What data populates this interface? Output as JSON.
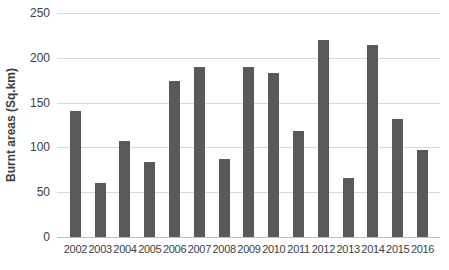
{
  "chart_data": {
    "type": "bar",
    "title": "",
    "categories": [
      "2002",
      "2003",
      "2004",
      "2005",
      "2006",
      "2007",
      "2008",
      "2009",
      "2010",
      "2011",
      "2012",
      "2013",
      "2014",
      "2015",
      "2016"
    ],
    "values": [
      141,
      60,
      107,
      84,
      174,
      190,
      87,
      190,
      183,
      118,
      220,
      66,
      214,
      132,
      97
    ],
    "xlabel": "",
    "ylabel": "Burnt areas (Sq.km)",
    "ylim": [
      0,
      250
    ],
    "yticks": [
      0,
      50,
      100,
      150,
      200,
      250
    ],
    "grid": true,
    "legend": false,
    "colors": {
      "bar": "#595959",
      "gridline": "#d9d9d9",
      "axis_line": "#bfbfbf",
      "text": "#404040",
      "background": "#ffffff"
    }
  }
}
